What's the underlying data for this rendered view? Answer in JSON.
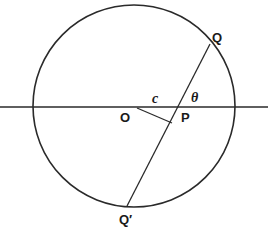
{
  "diagram": {
    "labels": {
      "Q": "Q",
      "Q_prime": "Q′",
      "O": "O",
      "P": "P",
      "c": "c",
      "theta": "θ"
    },
    "colors": {
      "stroke": "#2a2a2a",
      "background": "#ffffff"
    }
  }
}
